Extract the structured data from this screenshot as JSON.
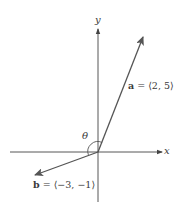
{
  "diagram": {
    "type": "vector-angle-diagram",
    "axes": {
      "x_label": "x",
      "y_label": "y"
    },
    "angle_label": "θ",
    "vectors": [
      {
        "name": "a",
        "components": "⟨2, 5⟩",
        "label_sep": " = ",
        "text": "a = ⟨2, 5⟩"
      },
      {
        "name": "b",
        "components": "⟨−3, −1⟩",
        "label_sep": " = ",
        "text": "b = ⟨−3, −1⟩"
      }
    ],
    "colors": {
      "axis": "#444444",
      "vector": "#555555",
      "text": "#3a3a3a"
    }
  }
}
